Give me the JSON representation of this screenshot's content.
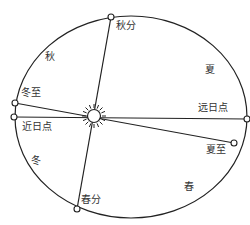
{
  "diagram": {
    "type": "earth-orbit",
    "colors": {
      "line": "#222222",
      "text": "#333333",
      "background": "#ffffff"
    },
    "orbit": {
      "cx": 131,
      "cy": 117,
      "rx": 116,
      "ry": 101
    },
    "sun": {
      "x": 94,
      "y": 116,
      "r": 6,
      "icon": "sun-icon"
    },
    "points": {
      "winter_solstice": {
        "label": "冬至",
        "x": 15,
        "y": 103
      },
      "perihelion": {
        "label": "近日点",
        "x": 14,
        "y": 117
      },
      "autumn_equinox": {
        "label": "秋分",
        "x": 111,
        "y": 17
      },
      "aphelion": {
        "label": "远日点",
        "x": 247,
        "y": 119
      },
      "summer_solstice": {
        "label": "夏至",
        "x": 234,
        "y": 143
      },
      "spring_equinox": {
        "label": "春分",
        "x": 77,
        "y": 209
      }
    },
    "seasons": {
      "autumn": "秋",
      "summer": "夏",
      "winter": "冬",
      "spring": "春"
    }
  }
}
